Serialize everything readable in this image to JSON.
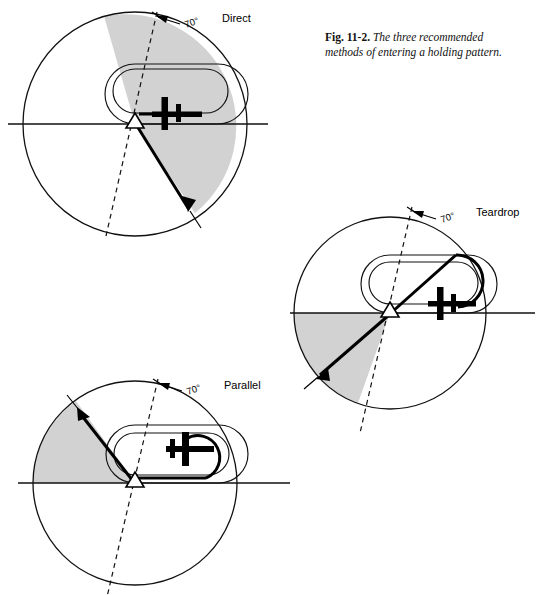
{
  "figure": {
    "caption_prefix": "Fig. 11-2.",
    "caption_text": "The three recommended methods of entering a holding pattern.",
    "caption_line1": "The three recommended",
    "caption_line2": "methods of entering a holding pattern."
  },
  "colors": {
    "shade_gray": "#d2d2d2",
    "line_black": "#111111",
    "page_white": "#ffffff"
  },
  "diagrams": [
    {
      "id": "direct",
      "label": "Direct",
      "angle_label": "70°",
      "fix_symbol": "triangle",
      "aircraft_heading": "left",
      "sector_description": "shaded sector right of the dashed 70-degree line, below and above the holding course"
    },
    {
      "id": "teardrop",
      "label": "Teardrop",
      "angle_label": "70°",
      "fix_symbol": "triangle",
      "aircraft_heading": "left",
      "sector_description": "shaded sector left of fix between the inbound radial and the dashed 70-degree line"
    },
    {
      "id": "parallel",
      "label": "Parallel",
      "angle_label": "70°",
      "fix_symbol": "triangle",
      "aircraft_heading": "right",
      "sector_description": "shaded sector upper-left of the fix between the horizontal course and the bold entry radial"
    }
  ]
}
